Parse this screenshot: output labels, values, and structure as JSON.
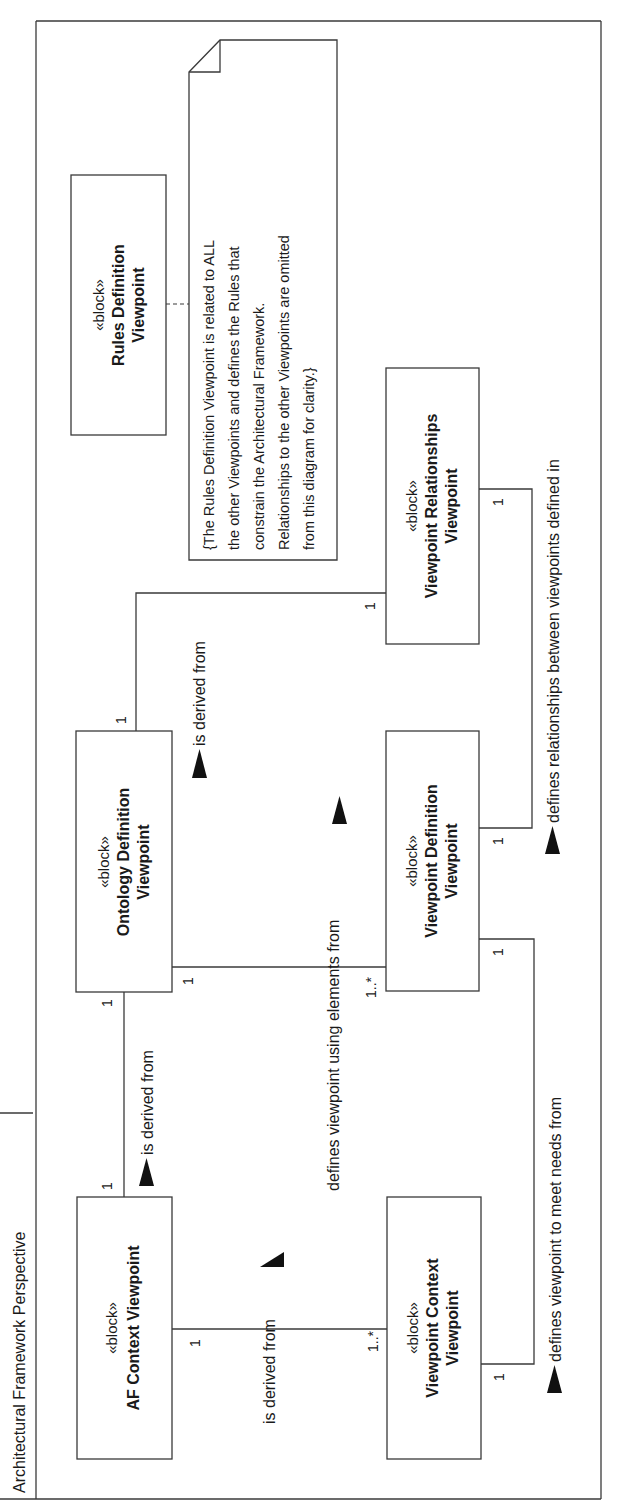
{
  "frame": {
    "title": "Architectural Framework Perspective"
  },
  "blocks": [
    {
      "id": "rules",
      "stereotype": "«block»",
      "name_line1": "Rules Definition",
      "name_line2": "Viewpoint"
    },
    {
      "id": "ontology",
      "stereotype": "«block»",
      "name_line1": "Ontology Definition",
      "name_line2": "Viewpoint"
    },
    {
      "id": "af_context",
      "stereotype": "«block»",
      "name_line1": "AF Context Viewpoint",
      "name_line2": ""
    },
    {
      "id": "vp_relationships",
      "stereotype": "«block»",
      "name_line1": "Viewpoint Relationships",
      "name_line2": "Viewpoint"
    },
    {
      "id": "vp_definition",
      "stereotype": "«block»",
      "name_line1": "Viewpoint Definition",
      "name_line2": "Viewpoint"
    },
    {
      "id": "vp_context",
      "stereotype": "«block»",
      "name_line1": "Viewpoint Context",
      "name_line2": "Viewpoint"
    }
  ],
  "note": {
    "lines": [
      "{The Rules Definition Viewpoint  is related to ALL",
      "the other Viewpoints and defines the Rules that",
      "constrain the Architectural Framework.",
      "Relationships to the other Viewpoints are omitted",
      "from this diagram for clarity.}"
    ]
  },
  "associations": [
    {
      "id": "af_to_ontology",
      "label": "is derived from",
      "mult_source": "1",
      "mult_target": "1"
    },
    {
      "id": "vprel_to_ontology",
      "label": "is derived from",
      "mult_source": "1",
      "mult_target": "1"
    },
    {
      "id": "vpdef_to_ontology",
      "label": "defines viewpoint using elements from",
      "mult_source": "1..*",
      "mult_target": "1"
    },
    {
      "id": "vpctx_to_af",
      "label": "is derived from",
      "mult_source": "1..*",
      "mult_target": "1"
    },
    {
      "id": "vprel_to_vpdef",
      "label": "defines relationships between viewpoints defined in",
      "mult_source": "1",
      "mult_target": "1"
    },
    {
      "id": "vpdef_to_vpctx",
      "label": "defines viewpoint to meet needs from",
      "mult_source": "1",
      "mult_target": "1"
    }
  ],
  "colors": {
    "line": "#3a3a3a",
    "text": "#1a1a1a",
    "background": "#ffffff"
  }
}
